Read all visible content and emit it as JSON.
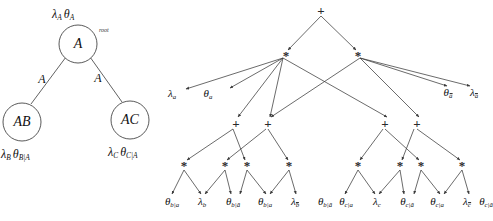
{
  "figure": {
    "left_tree": {
      "name": "phylogenetic-tree",
      "root": {
        "node_label": "A",
        "annotation": "root",
        "params": "λₐ θₐ",
        "lambda": "λ",
        "lambda_sub": "A",
        "theta": "θ",
        "theta_sub": "A"
      },
      "children": [
        {
          "node_label": "AB",
          "edge_label": "A",
          "lambda": "λ",
          "lambda_sub": "B",
          "theta": "θ",
          "theta_sub": "B|A"
        },
        {
          "node_label": "AC",
          "edge_label": "A",
          "lambda": "λ",
          "lambda_sub": "C",
          "theta": "θ",
          "theta_sub": "C|A"
        }
      ]
    },
    "right_tree": {
      "name": "arithmetic-circuit",
      "operators": {
        "plus": "+",
        "times": "*"
      },
      "leaves": [
        {
          "sym": "λ",
          "sub": "a",
          "bar": false
        },
        {
          "sym": "θ",
          "sub": "a",
          "bar": false
        },
        {
          "sym": "θ",
          "sub": "a",
          "bar": true
        },
        {
          "sym": "λ",
          "sub": "a",
          "bar": true
        },
        {
          "sym": "θ",
          "sub": "b|a",
          "bar": false
        },
        {
          "sym": "λ",
          "sub": "b",
          "bar": false
        },
        {
          "sym": "θ",
          "sub": "b|ā",
          "bar": false
        },
        {
          "sym": "θ",
          "sub": "b|a",
          "bar": false
        },
        {
          "sym": "λ",
          "sub": "b",
          "bar": true
        },
        {
          "sym": "θ",
          "sub": "b|ā",
          "bar": false
        },
        {
          "sym": "θ",
          "sub": "c|a",
          "bar": false
        },
        {
          "sym": "λ",
          "sub": "c",
          "bar": false
        },
        {
          "sym": "θ",
          "sub": "c|ā",
          "bar": false
        },
        {
          "sym": "θ",
          "sub": "c|a",
          "bar": false
        },
        {
          "sym": "λ",
          "sub": "c",
          "bar": true
        },
        {
          "sym": "θ",
          "sub": "c|ā",
          "bar": false
        }
      ]
    },
    "colors": {
      "ink": "#111111",
      "edge": "#3a3a3a",
      "background": "#ffffff"
    }
  }
}
